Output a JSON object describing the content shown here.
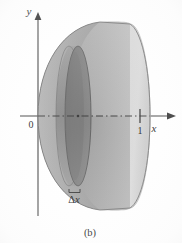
{
  "figure": {
    "caption": "(b)",
    "kind": "solid-of-revolution-paraboloid",
    "axes": {
      "x_label": "x",
      "y_label": "y",
      "origin_label": "0",
      "x_ticks": [
        {
          "value": "1",
          "label": "1"
        }
      ]
    },
    "annotations": {
      "slice_delta": "Δ",
      "slice_var": "x",
      "slice_label": "Δx"
    },
    "colors": {
      "background": "#ffffff",
      "end_cap_light": "#d2d2d2",
      "end_cap_edge": "#bdbdbd",
      "outer_surface_mid": "#a9a9a9",
      "outer_surface_dark": "#8f8f8f",
      "inner_disk_dark": "#7f7f7f",
      "inner_disk_shadow": "#6e6e6e",
      "slab_side": "#9a9a9a",
      "axis_line": "#2b2b2b",
      "outline": "#6a6a6a",
      "text": "#1a1a1a"
    },
    "geometry": {
      "origin_x": 38,
      "axis_y": 116,
      "tick_one_x": 140,
      "end_cap_center_x": 130,
      "end_cap_rx": 20,
      "end_cap_ry": 92,
      "slice_center_x": 78,
      "slice_rx": 13,
      "slice_ry": 70,
      "slice_thickness": 9
    }
  }
}
